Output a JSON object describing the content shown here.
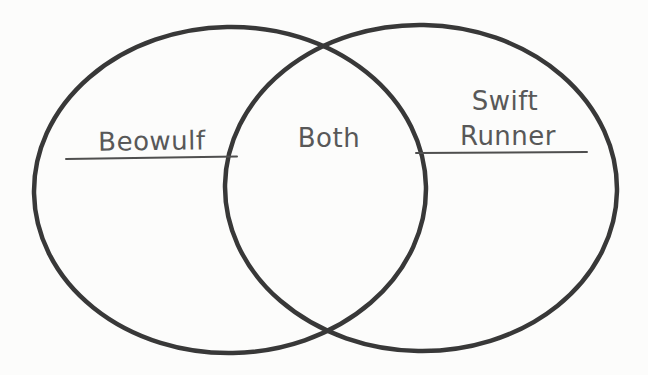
{
  "diagram": {
    "type": "venn",
    "background_color": "#fcfcfb",
    "circle_stroke_color": "#383838",
    "text_color": "#585858",
    "left_set": {
      "label": "Beowulf"
    },
    "intersection": {
      "label": "Both"
    },
    "right_set": {
      "label_line1": "Swift",
      "label_line2": "Runner"
    }
  }
}
